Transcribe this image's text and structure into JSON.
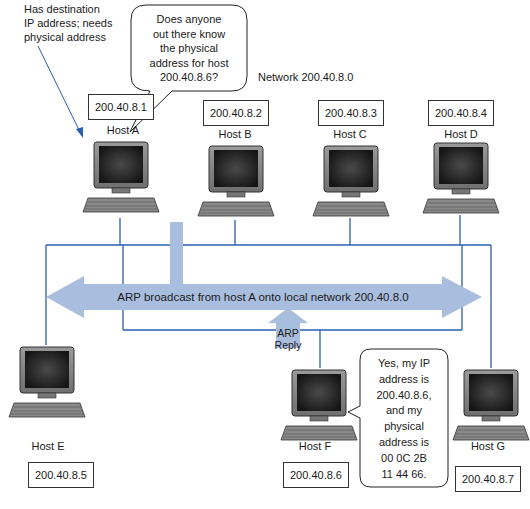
{
  "network": {
    "label": "Network 200.40.8.0"
  },
  "annotations": {
    "host_a_note_lines": [
      "Has destination",
      "IP address; needs",
      "physical address"
    ],
    "question_bubble_lines": [
      "Does anyone",
      "out there know",
      "the physical",
      "address for host",
      "200.40.8.6?"
    ],
    "reply_bubble_lines": [
      "Yes, my IP",
      "address is",
      "200.40.8.6,",
      "and my",
      "physical",
      "address is",
      "00 0C 2B",
      "11 44 66."
    ],
    "broadcast_label": "ARP broadcast from host A onto local network 200.40.8.0",
    "arp_reply_lines": [
      "ARP",
      "Reply"
    ]
  },
  "hosts": [
    {
      "name": "Host A",
      "ip": "200.40.8.1"
    },
    {
      "name": "Host B",
      "ip": "200.40.8.2"
    },
    {
      "name": "Host C",
      "ip": "200.40.8.3"
    },
    {
      "name": "Host D",
      "ip": "200.40.8.4"
    },
    {
      "name": "Host E",
      "ip": "200.40.8.5"
    },
    {
      "name": "Host F",
      "ip": "200.40.8.6"
    },
    {
      "name": "Host G",
      "ip": "200.40.8.7"
    }
  ],
  "colors": {
    "network_line": "#2a5fb0",
    "arrow_fill": "#a9bedf",
    "screen": "#151515",
    "computer_body": "#6f6f6f"
  }
}
